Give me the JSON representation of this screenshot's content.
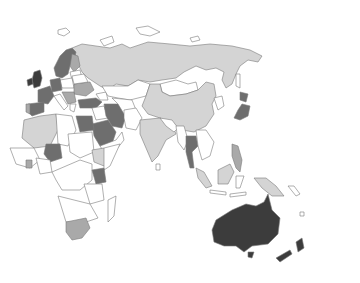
{
  "map": {
    "type": "choropleth",
    "region": "Europe, Africa, Asia, Oceania",
    "background_color": "#ffffff",
    "border_color": "#7a7a7a",
    "legend": null,
    "title": null,
    "shade_levels": {
      "none": "#ffffff",
      "light": "#d4d4d4",
      "mid": "#a9a9a9",
      "dark": "#6e6e6e",
      "darkest": "#3c3c3c"
    },
    "regions": [
      {
        "name": "United Kingdom & Ireland",
        "shade": "darkest"
      },
      {
        "name": "Australia",
        "shade": "darkest"
      },
      {
        "name": "New Zealand",
        "shade": "darkest"
      },
      {
        "name": "Scandinavia",
        "shade": "dark"
      },
      {
        "name": "France",
        "shade": "dark"
      },
      {
        "name": "Spain",
        "shade": "dark"
      },
      {
        "name": "Germany",
        "shade": "dark"
      },
      {
        "name": "Turkey",
        "shade": "dark"
      },
      {
        "name": "Iran",
        "shade": "dark"
      },
      {
        "name": "Saudi Arabia",
        "shade": "dark"
      },
      {
        "name": "Egypt",
        "shade": "dark"
      },
      {
        "name": "Japan",
        "shade": "dark"
      },
      {
        "name": "Thailand",
        "shade": "dark"
      },
      {
        "name": "Philippines",
        "shade": "dark"
      },
      {
        "name": "Kenya",
        "shade": "dark"
      },
      {
        "name": "Niger/Chad region",
        "shade": "dark"
      },
      {
        "name": "South Africa",
        "shade": "mid"
      },
      {
        "name": "Ukraine",
        "shade": "mid"
      },
      {
        "name": "Ghana",
        "shade": "mid"
      },
      {
        "name": "Russia",
        "shade": "light"
      },
      {
        "name": "China",
        "shade": "light"
      },
      {
        "name": "India",
        "shade": "light"
      },
      {
        "name": "Kazakhstan",
        "shade": "light"
      },
      {
        "name": "Algeria",
        "shade": "light"
      },
      {
        "name": "Ethiopia",
        "shade": "light"
      },
      {
        "name": "Indonesia (Borneo/Sumatra)",
        "shade": "light"
      },
      {
        "name": "Papua New Guinea",
        "shade": "light"
      },
      {
        "name": "Mongolia",
        "shade": "none"
      },
      {
        "name": "Central Asia",
        "shade": "none"
      },
      {
        "name": "Sub-Saharan Africa (other)",
        "shade": "none"
      }
    ]
  }
}
